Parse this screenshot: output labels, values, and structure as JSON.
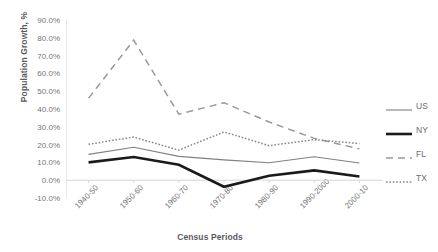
{
  "chart_data": {
    "type": "line",
    "title": "",
    "xlabel": "Census Periods",
    "ylabel": "Population Growth, %",
    "categories": [
      "1940-50",
      "1950-60",
      "1960-70",
      "1970-80",
      "1980-90",
      "1990-2000",
      "2000-10"
    ],
    "ylim": [
      -10,
      90
    ],
    "ytick_labels": [
      "90.0%",
      "80.0%",
      "70.0%",
      "60.0%",
      "50.0%",
      "40.0%",
      "30.0%",
      "20.0%",
      "10.0%",
      "0.0%",
      "-10.0%"
    ],
    "ytick_values": [
      90,
      80,
      70,
      60,
      50,
      40,
      30,
      20,
      10,
      0,
      -10
    ],
    "grid": false,
    "legend_position": "right",
    "series": [
      {
        "name": "US",
        "style": "solid-thin",
        "color": "#808080",
        "values": [
          14.5,
          18.5,
          13.4,
          11.4,
          9.8,
          13.2,
          9.7
        ]
      },
      {
        "name": "NY",
        "style": "solid-thick",
        "color": "#1a1a1a",
        "values": [
          10.0,
          13.0,
          8.7,
          -3.7,
          2.5,
          5.5,
          2.1
        ]
      },
      {
        "name": "FL",
        "style": "dashed",
        "color": "#999999",
        "values": [
          46.1,
          78.7,
          37.1,
          43.5,
          32.7,
          23.5,
          17.6
        ]
      },
      {
        "name": "TX",
        "style": "dotted",
        "color": "#888888",
        "values": [
          20.2,
          24.2,
          16.9,
          27.1,
          19.4,
          22.8,
          20.6
        ]
      }
    ]
  },
  "legend": {
    "items": [
      {
        "label": "US"
      },
      {
        "label": "NY"
      },
      {
        "label": "FL"
      },
      {
        "label": "TX"
      }
    ]
  }
}
